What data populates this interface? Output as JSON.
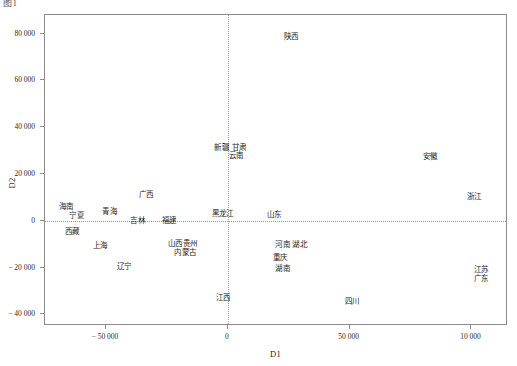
{
  "top_caption": "图1",
  "chart_data": {
    "type": "scatter",
    "title": "",
    "subtitle": "",
    "xlabel": "D1",
    "ylabel": "D2",
    "xlim": [
      -75000,
      115000
    ],
    "ylim": [
      -45000,
      88000
    ],
    "xticks": [
      -50000,
      0,
      50000,
      100000
    ],
    "xtick_labels": [
      "− 50 000",
      "0",
      "50 000",
      "10 000"
    ],
    "yticks": [
      -40000,
      -20000,
      0,
      20000,
      40000,
      60000,
      80000
    ],
    "ytick_labels": [
      "− 40 000",
      "− 20 000",
      "0",
      "20 000",
      "40 000",
      "60 000",
      "80 000"
    ],
    "grid": false,
    "legend": "none",
    "reference_lines": {
      "x": 0,
      "y": 0,
      "style": "dotted",
      "color": "#9a9a9a"
    },
    "marker_style": "text-label-only",
    "points": [
      {
        "label": "陕西",
        "x": 26000,
        "y": 79000
      },
      {
        "label": "新疆",
        "x": -2500,
        "y": 31500
      },
      {
        "label": "甘肃",
        "x": 4500,
        "y": 31500
      },
      {
        "label": "云南",
        "x": 3500,
        "y": 28000
      },
      {
        "label": "安徽",
        "x": 83000,
        "y": 27500
      },
      {
        "label": "浙江",
        "x": 101000,
        "y": 10500
      },
      {
        "label": "广西",
        "x": -33500,
        "y": 11500
      },
      {
        "label": "海南",
        "x": -66500,
        "y": 6500
      },
      {
        "label": "青海",
        "x": -48500,
        "y": 4000
      },
      {
        "label": "宁夏",
        "x": -62000,
        "y": 2500
      },
      {
        "label": "吉林",
        "x": -37000,
        "y": 500
      },
      {
        "label": "福建",
        "x": -24000,
        "y": 500
      },
      {
        "label": "黑龙江",
        "x": -2000,
        "y": 3500
      },
      {
        "label": "山东",
        "x": 19000,
        "y": 3000
      },
      {
        "label": "西藏",
        "x": -64000,
        "y": -4500
      },
      {
        "label": "上海",
        "x": -52500,
        "y": -10500
      },
      {
        "label": "山西",
        "x": -21500,
        "y": -9500
      },
      {
        "label": "贵州",
        "x": -15500,
        "y": -9500
      },
      {
        "label": "内蒙古",
        "x": -17500,
        "y": -13500
      },
      {
        "label": "辽宁",
        "x": -42500,
        "y": -19500
      },
      {
        "label": "河南",
        "x": 22500,
        "y": -10000
      },
      {
        "label": "湖北",
        "x": 29500,
        "y": -10000
      },
      {
        "label": "重庆",
        "x": 21500,
        "y": -15500
      },
      {
        "label": "湖南",
        "x": 22500,
        "y": -20000
      },
      {
        "label": "江苏",
        "x": 104000,
        "y": -20500
      },
      {
        "label": "广东",
        "x": 104000,
        "y": -24500
      },
      {
        "label": "江西",
        "x": -2000,
        "y": -32500
      },
      {
        "label": "四川",
        "x": 51000,
        "y": -34500
      }
    ]
  }
}
